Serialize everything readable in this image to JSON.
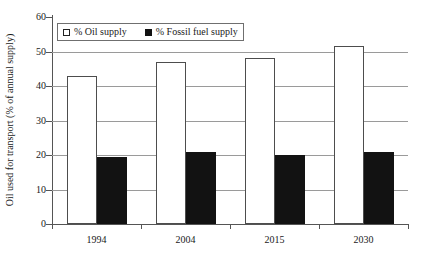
{
  "chart_data": {
    "type": "bar",
    "title": "",
    "xlabel": "",
    "ylabel": "Oil used for transport (% of annual supply)",
    "categories": [
      "1994",
      "2004",
      "2015",
      "2030"
    ],
    "series": [
      {
        "name": "% Oil supply",
        "color": "#ffffff",
        "values": [
          43,
          47,
          48,
          51.5
        ]
      },
      {
        "name": "% Fossil fuel supply",
        "color": "#121212",
        "values": [
          19.5,
          21,
          20,
          21
        ]
      }
    ],
    "ylim": [
      0,
      60
    ],
    "yticks": [
      0,
      10,
      20,
      30,
      40,
      50,
      60
    ],
    "ytick_labels": [
      "0",
      "10",
      "20",
      "30",
      "40",
      "50",
      "60"
    ],
    "grid": true,
    "legend_position": "top-left"
  },
  "legend": {
    "entries": [
      {
        "label": "% Oil supply",
        "swatch": "open-square-icon"
      },
      {
        "label": "% Fossil fuel supply",
        "swatch": "filled-square-icon"
      }
    ]
  }
}
